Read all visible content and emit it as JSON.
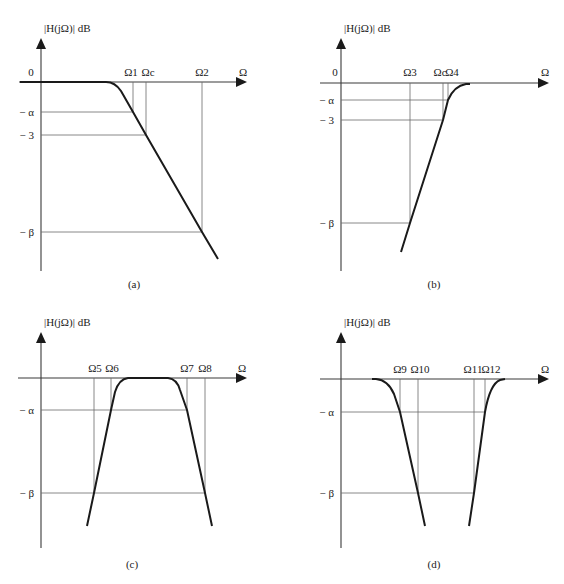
{
  "figure": {
    "panels": [
      {
        "id": "a",
        "caption": "(a)",
        "y_axis_label": "|H(jΩ)|  dB",
        "x_axis_label": "Ω",
        "zero_label": "0",
        "y_ticks": [
          "− α",
          "− 3",
          "− β"
        ],
        "x_marks": [
          "Ω1",
          "Ωc",
          "Ω2"
        ],
        "type": "lowpass"
      },
      {
        "id": "b",
        "caption": "(b)",
        "y_axis_label": "|H(jΩ)|  dB",
        "x_axis_label": "Ω",
        "zero_label": "0",
        "y_ticks": [
          "− α",
          "− 3",
          "− β"
        ],
        "x_marks": [
          "Ω3",
          "Ωc",
          "Ω4"
        ],
        "type": "highpass"
      },
      {
        "id": "c",
        "caption": "(c)",
        "y_axis_label": "|H(jΩ)|  dB",
        "x_axis_label": "Ω",
        "y_ticks": [
          "− α",
          "− β"
        ],
        "x_marks": [
          "Ω5",
          "Ω6",
          "Ω7",
          "Ω8"
        ],
        "type": "bandpass"
      },
      {
        "id": "d",
        "caption": "(d)",
        "y_axis_label": "|H(jΩ)|  dB",
        "x_axis_label": "Ω",
        "y_ticks": [
          "− α",
          "− β"
        ],
        "x_marks": [
          "Ω9",
          "Ω10",
          "Ω11",
          "Ω12"
        ],
        "type": "bandstop"
      }
    ]
  }
}
